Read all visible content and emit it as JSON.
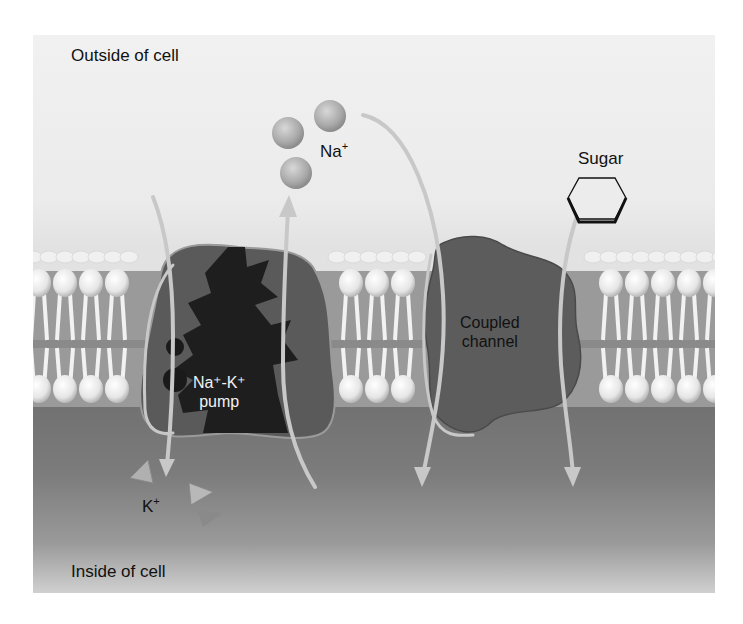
{
  "diagram": {
    "regions": {
      "outside_label": "Outside of cell",
      "inside_label": "Inside of cell"
    },
    "ions": {
      "sodium": {
        "symbol": "Na",
        "charge": "+",
        "count": 3,
        "shape": "sphere"
      },
      "potassium": {
        "symbol": "K",
        "charge": "+",
        "count": 3,
        "shape": "triangle"
      }
    },
    "molecules": {
      "sugar": {
        "label": "Sugar",
        "shape": "hexagon"
      }
    },
    "proteins": {
      "pump": {
        "line1": "Na⁺-K⁺",
        "line2": "pump"
      },
      "channel": {
        "line1": "Coupled",
        "line2": "channel"
      }
    },
    "structures": {
      "membrane": "phospholipid-bilayer"
    },
    "colors": {
      "outside_bg": "#ececec",
      "inside_bg": "#7a7a7a",
      "pump_body": "#5a5a5a",
      "pump_core": "#1e1e1e",
      "channel_body": "#5c5c5c",
      "arrow": "#c8c8c8"
    }
  }
}
